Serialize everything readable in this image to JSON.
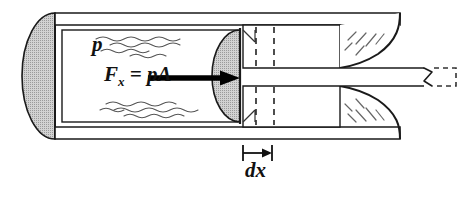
{
  "figure": {
    "domain": "fluid-mechanics-diagram",
    "width": 464,
    "height": 200,
    "background_color": "#ffffff"
  },
  "labels": {
    "pressure": "p",
    "force_symbol": "F",
    "force_subscript": "x",
    "force_equation_rhs": "= pA",
    "force_full": "Fx = pA",
    "element_width": "dx"
  },
  "colors": {
    "line": "#1a1a1a",
    "fill_shaded": "#c8c8c8",
    "fill_white": "#ffffff",
    "arrow": "#000000",
    "dashed": "#333333",
    "squiggle": "#555555",
    "hatch": "#666666"
  },
  "geometry": {
    "cylinder": {
      "outer_top_wall_y": 13,
      "outer_bottom_wall_y": 139,
      "wall_thickness": 12,
      "left_cap_x": 55,
      "chamber_left_x": 62,
      "chamber_right_x": 238,
      "chamber_top_y": 30,
      "chamber_bottom_y": 122
    },
    "left_end_cap": {
      "type": "half-ellipse",
      "center_x": 55,
      "center_y": 76,
      "rx": 33,
      "ry": 63,
      "shaded": true
    },
    "piston_face": {
      "type": "half-ellipse",
      "center_x": 212,
      "center_y": 76,
      "rx": 28,
      "ry": 48,
      "shaded": true,
      "flat_edge_x": 240
    },
    "force_arrow": {
      "x_start": 148,
      "x_end": 238,
      "y": 78,
      "head_length": 18,
      "head_half_width": 7
    },
    "dx_element": {
      "left_x": 243,
      "right_x": 272,
      "dim_line_y": 153,
      "tick_half_height": 8,
      "dashed_line_xs": [
        253,
        272
      ]
    },
    "nozzle": {
      "throat_top_y": 68,
      "throat_bottom_y": 86,
      "contour_start_x": 340,
      "contour_end_x": 402,
      "jet_end_x": 432
    },
    "jet_break": {
      "x": 432,
      "dashed_extension_x_end": 458
    }
  },
  "annotations": [
    {
      "name": "pressure-label",
      "text": "p",
      "x": 92,
      "y": 34
    },
    {
      "name": "force-label",
      "text": "Fx = pA",
      "x": 104,
      "y": 64
    },
    {
      "name": "dx-label",
      "text": "dx",
      "x": 245,
      "y": 160
    }
  ]
}
